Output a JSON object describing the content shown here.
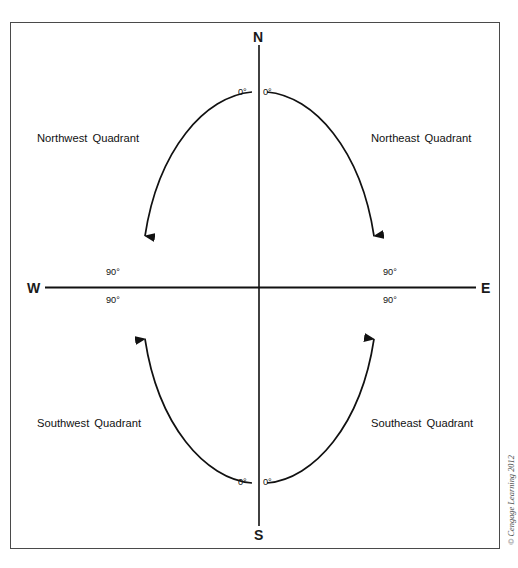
{
  "figure": {
    "cardinals": [
      {
        "name": "north",
        "label": "N"
      },
      {
        "name": "south",
        "label": "S"
      },
      {
        "name": "west",
        "label": "W"
      },
      {
        "name": "east",
        "label": "E"
      }
    ],
    "quadrants": [
      {
        "name": "northwest",
        "label": "Northwest  Quadrant"
      },
      {
        "name": "northeast",
        "label": "Northeast  Quadrant"
      },
      {
        "name": "southwest",
        "label": "Southwest  Quadrant"
      },
      {
        "name": "southeast",
        "label": "Southeast  Quadrant"
      }
    ],
    "angle_labels": {
      "nw_zero": "0°",
      "ne_zero": "0°",
      "sw_zero": "0°",
      "se_zero": "0°",
      "nw_ninety": "90°",
      "ne_ninety": "90°",
      "sw_ninety": "90°",
      "se_ninety": "90°"
    },
    "credit": "© Cengage Learning 2012",
    "colors": {
      "line": "#111111",
      "frame": "#4a4a4a",
      "text": "#1a1a1a",
      "credit": "#4d4d4d",
      "background": "#ffffff"
    }
  }
}
